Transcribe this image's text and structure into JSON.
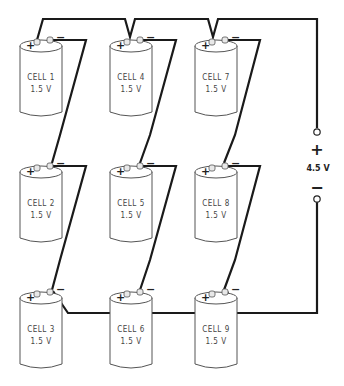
{
  "diagram": {
    "cells": [
      {
        "id": 1,
        "label": "CELL 1",
        "voltage": "1.5 V",
        "col": 0,
        "row": 0
      },
      {
        "id": 2,
        "label": "CELL 2",
        "voltage": "1.5 V",
        "col": 0,
        "row": 1
      },
      {
        "id": 3,
        "label": "CELL 3",
        "voltage": "1.5 V",
        "col": 0,
        "row": 2
      },
      {
        "id": 4,
        "label": "CELL 4",
        "voltage": "1.5 V",
        "col": 1,
        "row": 0
      },
      {
        "id": 5,
        "label": "CELL 5",
        "voltage": "1.5 V",
        "col": 1,
        "row": 1
      },
      {
        "id": 6,
        "label": "CELL 6",
        "voltage": "1.5 V",
        "col": 1,
        "row": 2
      },
      {
        "id": 7,
        "label": "CELL 7",
        "voltage": "1.5 V",
        "col": 2,
        "row": 0
      },
      {
        "id": 8,
        "label": "CELL 8",
        "voltage": "1.5 V",
        "col": 2,
        "row": 1
      },
      {
        "id": 9,
        "label": "CELL 9",
        "voltage": "1.5 V",
        "col": 2,
        "row": 2
      }
    ],
    "terminal_plus": "+",
    "terminal_minus": "−",
    "output": {
      "plus": "+",
      "minus": "−",
      "voltage": "4.5 V"
    }
  }
}
